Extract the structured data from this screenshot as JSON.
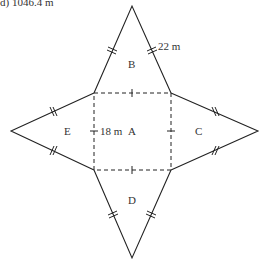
{
  "caption": "d) 1046.4 m",
  "diagram": {
    "type": "net-of-square-pyramid",
    "faces": {
      "base": "A",
      "top": "B",
      "right": "C",
      "bottom": "D",
      "left": "E"
    },
    "measurements": {
      "base_side": "18 m",
      "slant_edge": "22 m"
    },
    "colors": {
      "line": "#222222",
      "text": "#333333"
    }
  }
}
